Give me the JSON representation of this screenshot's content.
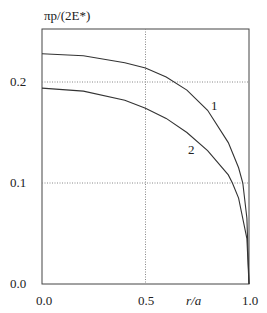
{
  "chart_data": {
    "type": "line",
    "title": "",
    "xlabel": "r/a",
    "ylabel": "πp/(2E*)",
    "xlim": [
      0.0,
      1.0
    ],
    "ylim": [
      0.0,
      0.25
    ],
    "x_ticks": [
      "0.0",
      "0.5",
      "1.0"
    ],
    "y_ticks": [
      "0.0",
      "0.1",
      "0.2"
    ],
    "grid": "dotted at x=0.5, y=0.1, y=0.2",
    "series": [
      {
        "name": "1",
        "x": [
          0.0,
          0.2,
          0.4,
          0.5,
          0.6,
          0.7,
          0.8,
          0.9,
          0.95,
          0.97,
          0.99,
          1.0
        ],
        "values": [
          0.228,
          0.226,
          0.219,
          0.214,
          0.205,
          0.192,
          0.172,
          0.14,
          0.115,
          0.1,
          0.065,
          0.0
        ]
      },
      {
        "name": "2",
        "x": [
          0.0,
          0.2,
          0.4,
          0.5,
          0.6,
          0.7,
          0.8,
          0.9,
          0.92,
          0.95,
          0.99,
          1.0
        ],
        "values": [
          0.194,
          0.191,
          0.182,
          0.174,
          0.164,
          0.15,
          0.132,
          0.108,
          0.1,
          0.085,
          0.045,
          0.0
        ]
      }
    ],
    "annotations": [
      {
        "text": "1",
        "near_series": "1"
      },
      {
        "text": "2",
        "near_series": "2"
      }
    ]
  },
  "labels": {
    "ylabel": "πp/(2E*)",
    "xlabel": "r/a",
    "x0": "0.0",
    "x05": "0.5",
    "x1": "1.0",
    "y0": "0.0",
    "y1": "0.1",
    "y2": "0.2",
    "curve1": "1",
    "curve2": "2"
  }
}
